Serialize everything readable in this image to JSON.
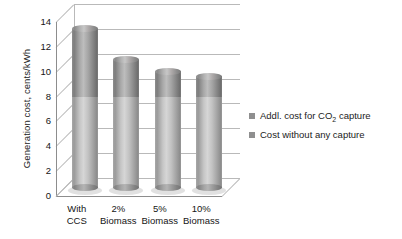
{
  "chart_data": {
    "type": "bar",
    "subtype": "stacked-3d-cylinder",
    "title": "",
    "xlabel": "",
    "ylabel": "Generation cost, cents/kWh",
    "categories": [
      "With CCS",
      "2% Biomass",
      "5% Biomass",
      "10% Biomass"
    ],
    "category_lines": [
      [
        "With",
        "CCS"
      ],
      [
        "2%",
        "Biomass"
      ],
      [
        "5%",
        "Biomass"
      ],
      [
        "10%",
        "Biomass"
      ]
    ],
    "series": [
      {
        "name": "Cost without any capture",
        "color": "#b9b9b9",
        "values": [
          7.3,
          7.3,
          7.3,
          7.3
        ]
      },
      {
        "name": "Addl. cost for CO2 capture",
        "color": "#8f8f8f",
        "values": [
          5.5,
          3.0,
          2.1,
          1.7
        ]
      }
    ],
    "totals": [
      12.8,
      10.3,
      9.4,
      9.0
    ],
    "ylim": [
      0,
      14
    ],
    "yticks": [
      0,
      2,
      4,
      6,
      8,
      10,
      12,
      14
    ],
    "ytick_labels": [
      "0",
      "2",
      "4",
      "6",
      "8",
      "10",
      "12",
      "14"
    ],
    "grid": true,
    "legend_position": "right"
  },
  "legend": {
    "items": [
      {
        "label_prefix": "Addl. cost for CO",
        "label_sub": "2",
        "label_suffix": " capture",
        "color": "#8f8f8f"
      },
      {
        "label_prefix": "Cost without any capture",
        "label_sub": "",
        "label_suffix": "",
        "color": "#8f8f8f"
      }
    ]
  }
}
